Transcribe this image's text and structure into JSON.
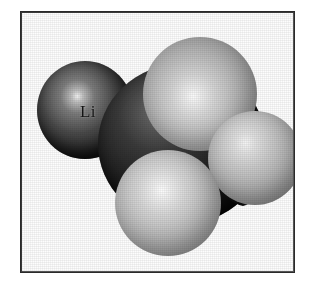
{
  "figure": {
    "type": "space-filling-molecular-model",
    "frame": {
      "border_color": "#2a2a2a",
      "background_color": "#fdfdfd"
    },
    "page_background": "#ffffff",
    "atoms": [
      {
        "id": "lithium",
        "label": "Li",
        "role": "metal-atom",
        "shade": "dark",
        "color": "#2a2a2a"
      },
      {
        "id": "carbon",
        "label": "",
        "role": "central-atom",
        "shade": "dark",
        "color": "#111111"
      },
      {
        "id": "hydrogen-1",
        "label": "",
        "role": "substituent-atom",
        "shade": "light",
        "color": "#c9c9c9"
      },
      {
        "id": "hydrogen-2",
        "label": "",
        "role": "substituent-atom",
        "shade": "light",
        "color": "#cccccc"
      },
      {
        "id": "hydrogen-3",
        "label": "",
        "role": "substituent-atom",
        "shade": "light",
        "color": "#bdbdbd"
      }
    ]
  }
}
